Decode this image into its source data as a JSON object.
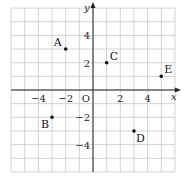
{
  "chart_data": {
    "type": "scatter",
    "title": "",
    "xlabel": "x",
    "ylabel": "y",
    "xlim": [
      -6,
      6
    ],
    "ylim": [
      -6,
      6
    ],
    "grid": true,
    "origin_label": "O",
    "x_ticks": [
      {
        "value": -4,
        "label": "−4"
      },
      {
        "value": -2,
        "label": "−2"
      },
      {
        "value": 2,
        "label": "2"
      },
      {
        "value": 4,
        "label": "4"
      }
    ],
    "y_ticks": [
      {
        "value": 4,
        "label": "4"
      },
      {
        "value": 2,
        "label": "2"
      },
      {
        "value": -2,
        "label": "−2"
      },
      {
        "value": -4,
        "label": "−4"
      }
    ],
    "points": [
      {
        "name": "A",
        "x": -2,
        "y": 3,
        "label_pos": "upper-left"
      },
      {
        "name": "B",
        "x": -3,
        "y": -2,
        "label_pos": "lower-left"
      },
      {
        "name": "C",
        "x": 1,
        "y": 2,
        "label_pos": "upper-right"
      },
      {
        "name": "D",
        "x": 3,
        "y": -3,
        "label_pos": "lower-right"
      },
      {
        "name": "E",
        "x": 5,
        "y": 1,
        "label_pos": "upper-right"
      }
    ]
  }
}
